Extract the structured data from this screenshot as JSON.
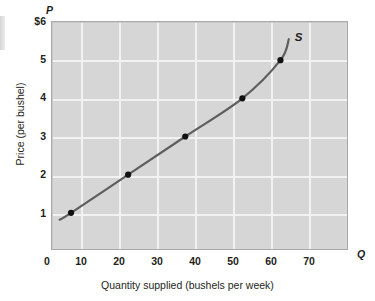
{
  "figure": {
    "name": "supply-curve-figure"
  },
  "chart_data": {
    "type": "line",
    "title": "",
    "subtitle": "",
    "xlabel": "Quantity supplied (bushels per week)",
    "ylabel": "Price (per bushel)",
    "x_axis_symbol": "Q",
    "y_axis_symbol": "P",
    "xlim": [
      0,
      78
    ],
    "ylim": [
      0,
      6
    ],
    "grid": true,
    "legend_position": "none",
    "xticks": [
      0,
      10,
      20,
      30,
      40,
      50,
      60,
      70
    ],
    "xtick_labels": [
      "0",
      "10",
      "20",
      "30",
      "40",
      "50",
      "60",
      "70"
    ],
    "yticks": [
      1,
      2,
      3,
      4,
      5,
      6
    ],
    "ytick_labels": [
      "1",
      "2",
      "3",
      "4",
      "5",
      "$6"
    ],
    "series": [
      {
        "name": "S",
        "label": "S",
        "color": "#5e5e5e",
        "marker_color": "#111111",
        "x": [
          5,
          20,
          35,
          50,
          60
        ],
        "y": [
          1,
          2,
          3,
          4,
          5
        ],
        "annotation": "S"
      }
    ],
    "annotations": [
      {
        "text": "S",
        "x": 64,
        "y": 5.55
      }
    ]
  },
  "colors": {
    "plot_background": "#d6d6d6",
    "gridline": "#f2f2f2",
    "curve": "#5e5e5e",
    "marker": "#111111",
    "border": "#a9a9a9",
    "text": "#231f20"
  }
}
